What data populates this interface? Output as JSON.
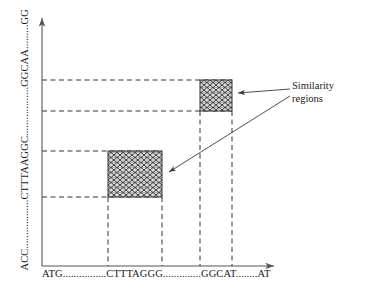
{
  "figure": {
    "name": "dotplot-similarity-regions",
    "axes": {
      "x_label": "ATG................CTTTAGGG..............GGCAT........AT",
      "y_label": "ACC..................CTTTAAGGC..................GGCAA.........GG",
      "x_axis_name": "x-axis-sequence",
      "y_axis_name": "y-axis-sequence",
      "axis_color": "#555555",
      "arrow_x_name": "x-axis-arrow",
      "arrow_y_name": "y-axis-arrow"
    },
    "annotation": {
      "line1": "Similarity",
      "line2": "regions"
    },
    "similarity_regions": [
      {
        "name": "similarity-region-upper",
        "x": 200,
        "y": 80,
        "width": 32,
        "height": 31,
        "fill": "#d8d8d8",
        "stroke": "#333333"
      },
      {
        "name": "similarity-region-lower",
        "x": 108,
        "y": 151,
        "width": 54,
        "height": 46,
        "fill": "#d8d8d8",
        "stroke": "#333333"
      }
    ],
    "guide_lines": {
      "color": "#333333",
      "horizontal_y": [
        80,
        111,
        151,
        197
      ],
      "vertical_x": [
        108,
        162,
        200,
        232
      ]
    },
    "leader_arrows": [
      {
        "name": "leader-arrow-upper",
        "from_x": 290,
        "from_y": 88,
        "to_x": 237,
        "to_y": 94
      },
      {
        "name": "leader-arrow-lower",
        "from_x": 290,
        "from_y": 97,
        "to_x": 168,
        "to_y": 172
      }
    ]
  }
}
